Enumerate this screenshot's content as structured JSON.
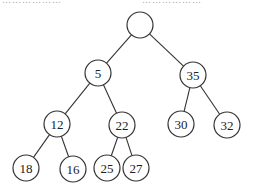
{
  "caption_fragment": {
    "left": "………………",
    "right": "………………"
  },
  "tree": {
    "radius": 13,
    "nodes": [
      {
        "id": "root",
        "label": "",
        "x": 140,
        "y": 25
      },
      {
        "id": "n5",
        "label": "5",
        "x": 98,
        "y": 73
      },
      {
        "id": "n35",
        "label": "35",
        "x": 193,
        "y": 75
      },
      {
        "id": "n12",
        "label": "12",
        "x": 57,
        "y": 124
      },
      {
        "id": "n22",
        "label": "22",
        "x": 122,
        "y": 125
      },
      {
        "id": "n30",
        "label": "30",
        "x": 181,
        "y": 124
      },
      {
        "id": "n32",
        "label": "32",
        "x": 227,
        "y": 125
      },
      {
        "id": "n18",
        "label": "18",
        "x": 26,
        "y": 168
      },
      {
        "id": "n16",
        "label": "16",
        "x": 73,
        "y": 169
      },
      {
        "id": "n25",
        "label": "25",
        "x": 107,
        "y": 168
      },
      {
        "id": "n27",
        "label": "27",
        "x": 136,
        "y": 168
      }
    ],
    "edges": [
      [
        "root",
        "n5"
      ],
      [
        "root",
        "n35"
      ],
      [
        "n5",
        "n12"
      ],
      [
        "n5",
        "n22"
      ],
      [
        "n35",
        "n30"
      ],
      [
        "n35",
        "n32"
      ],
      [
        "n12",
        "n18"
      ],
      [
        "n12",
        "n16"
      ],
      [
        "n22",
        "n25"
      ],
      [
        "n22",
        "n27"
      ]
    ]
  }
}
